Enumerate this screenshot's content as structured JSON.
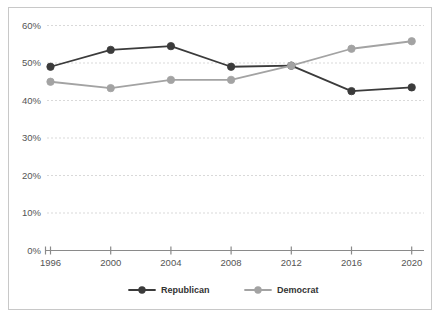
{
  "chart_data": {
    "type": "line",
    "title": "",
    "subtitle": "",
    "xlabel": "",
    "ylabel": "",
    "categories": [
      "1996",
      "2000",
      "2004",
      "2008",
      "2012",
      "2016",
      "2020"
    ],
    "x_tick_labels": [
      "1996",
      "2000",
      "2004",
      "2008",
      "2012",
      "2016",
      "2020"
    ],
    "y_tick_labels": [
      "0%",
      "10%",
      "20%",
      "30%",
      "40%",
      "50%",
      "60%"
    ],
    "y_tick_values": [
      0,
      10,
      20,
      30,
      40,
      50,
      60
    ],
    "ylim": [
      0,
      60
    ],
    "grid": true,
    "grid_axis": "y",
    "grid_style": "dotted",
    "legend_position": "bottom-center",
    "series": [
      {
        "name": "Republican",
        "color": "#3b3b3b",
        "marker": "circle",
        "values": [
          49.0,
          53.5,
          54.5,
          49.0,
          49.3,
          42.5,
          43.5
        ]
      },
      {
        "name": "Democrat",
        "color": "#a3a3a3",
        "marker": "circle",
        "values": [
          45.0,
          43.3,
          45.5,
          45.5,
          49.3,
          53.8,
          55.8
        ]
      }
    ]
  },
  "legend": {
    "items": [
      {
        "label": "Republican",
        "color": "#3b3b3b"
      },
      {
        "label": "Democrat",
        "color": "#a3a3a3"
      }
    ]
  },
  "axes": {
    "y_axis_name": "percentage-axis",
    "x_axis_name": "year-axis"
  },
  "colors": {
    "republican": "#3b3b3b",
    "democrat": "#a3a3a3",
    "grid": "#d9d9d9",
    "axis": "#8a8a8a",
    "border": "#c8c8c8",
    "text": "#555555",
    "background": "#ffffff"
  }
}
